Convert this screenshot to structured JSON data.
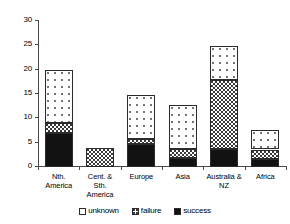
{
  "chart_data": {
    "type": "bar",
    "subtype": "stacked-bar",
    "title": "",
    "xlabel": "",
    "ylabel": "",
    "ylim": [
      0,
      30
    ],
    "yticks": [
      0,
      5,
      10,
      15,
      20,
      25,
      30
    ],
    "grid": false,
    "legend_position": "bottom",
    "categories": [
      "Nth. America",
      "Cent. & Sth. America",
      "Europe",
      "Asia",
      "Australia & NZ",
      "Africa"
    ],
    "category_lines": [
      [
        "Nth.",
        "America"
      ],
      [
        "Cent. &",
        "Sth.",
        "America"
      ],
      [
        "Europe"
      ],
      [
        "Asia"
      ],
      [
        "Australia &",
        "NZ"
      ],
      [
        "Africa"
      ]
    ],
    "series": [
      {
        "name": "success",
        "color": "#121212",
        "values": [
          7.0,
          0.0,
          4.7,
          1.8,
          3.8,
          1.7
        ]
      },
      {
        "name": "failure",
        "color": "#ffffff",
        "values": [
          2.0,
          3.9,
          1.0,
          1.9,
          14.0,
          1.9
        ]
      },
      {
        "name": "unknown",
        "color": "#ffffff",
        "values": [
          11.0,
          0.0,
          9.0,
          9.0,
          7.0,
          4.1
        ]
      }
    ],
    "totals": [
      20.0,
      3.9,
      14.7,
      12.7,
      24.8,
      7.7
    ],
    "legend": [
      {
        "key": "unknown",
        "label": "unknown"
      },
      {
        "key": "failure",
        "label": "failure"
      },
      {
        "key": "success",
        "label": "success"
      }
    ]
  }
}
